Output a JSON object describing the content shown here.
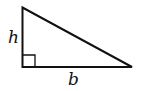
{
  "diagram": {
    "type": "right-triangle",
    "labels": {
      "height": "h",
      "base": "b"
    },
    "stroke_color": "#111111",
    "background": "#ffffff"
  }
}
